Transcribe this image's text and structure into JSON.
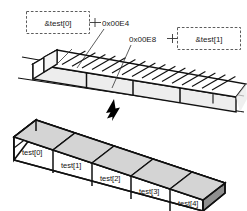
{
  "figure": {
    "top_diagram": {
      "name": "memory-strip",
      "labels": [
        {
          "id": "addr_left_box",
          "text": "&test[0]",
          "boxed": true
        },
        {
          "id": "addr_left_val",
          "text": "0x00E4",
          "boxed": false
        },
        {
          "id": "addr_right_val",
          "text": "0x00E8",
          "boxed": false
        },
        {
          "id": "addr_right_box",
          "text": "&test[1]",
          "boxed": true
        }
      ]
    },
    "arrow": {
      "name": "down-arrow",
      "direction": "down"
    },
    "bottom_diagram": {
      "name": "array-boxes",
      "cells": [
        {
          "label": "test[0]"
        },
        {
          "label": "test[1]"
        },
        {
          "label": "test[2]"
        },
        {
          "label": "test[3]"
        },
        {
          "label": "test[4]"
        }
      ]
    }
  },
  "colors": {
    "ink": "#111111",
    "dash_stroke": "#4a4a4a",
    "face_front": "#ffffff",
    "face_top": "#d4d4d4",
    "face_inner": "#bdbdbd",
    "face_end": "#8f8f8f",
    "strip_front": "#ededed",
    "background": "#ffffff"
  }
}
